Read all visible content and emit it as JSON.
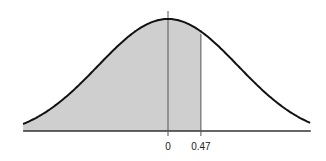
{
  "chart_data": {
    "type": "area",
    "title": "",
    "xlabel": "",
    "ylabel": "",
    "distribution": "standard normal",
    "shaded_region": {
      "from": "-inf",
      "to": 0.47
    },
    "xlim": [
      -2.07,
      2.04
    ],
    "tick_labels": [
      "0",
      "0.47"
    ],
    "ticks": [
      0,
      0.47
    ],
    "markers": [
      {
        "x": 0,
        "label": "0"
      },
      {
        "x": 0.47,
        "label": "0.47"
      }
    ],
    "grid": false,
    "legend": null
  },
  "colors": {
    "curve": "#111111",
    "shade": "#cfcfcf",
    "axis": "#333333",
    "marker_line": "#555555"
  }
}
